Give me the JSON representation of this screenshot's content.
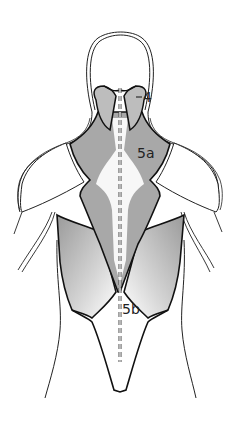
{
  "figure": {
    "labels": [
      {
        "id": "4",
        "text": "4"
      },
      {
        "id": "5a",
        "text": "5a"
      },
      {
        "id": "5b",
        "text": "5b"
      }
    ],
    "colors": {
      "outline": "#111111",
      "muscle_fill": "#a8a8a8",
      "muscle_fill_light": "#e6e6e6",
      "background": "#ffffff"
    }
  }
}
